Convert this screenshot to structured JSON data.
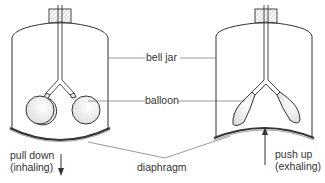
{
  "diagram": {
    "type": "bell jar lung model",
    "labels": {
      "bell_jar": "bell jar",
      "balloon": "balloon",
      "diaphragm": "diaphragm",
      "left_action_line1": "pull down",
      "left_action_line2": "(inhaling)",
      "right_action_line1": "push up",
      "right_action_line2": "(exhaling)"
    },
    "panels": [
      {
        "name": "inhaling",
        "diaphragm": "pulled down",
        "balloons": "inflated"
      },
      {
        "name": "exhaling",
        "diaphragm": "pushed up",
        "balloons": "deflated"
      }
    ],
    "colors": {
      "line": "#333333",
      "balloon_fill": "#f2f2f2",
      "hatch": "#888888"
    }
  }
}
